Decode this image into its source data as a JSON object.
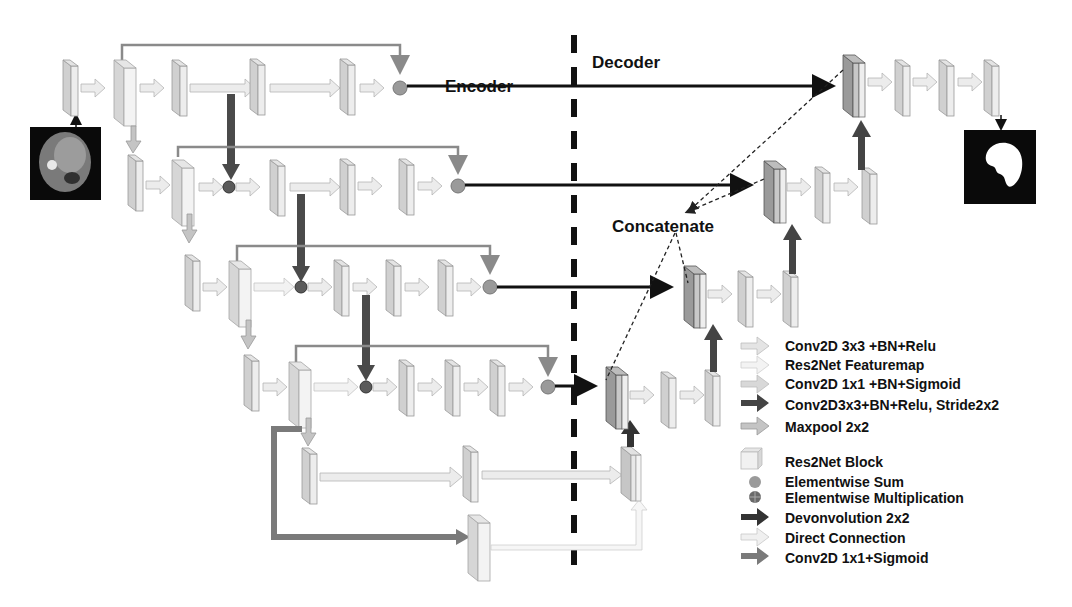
{
  "labels": {
    "encoder": "Encoder",
    "decoder": "Decoder",
    "concatenate": "Concatenate"
  },
  "images": {
    "input": "input-ct-slice",
    "output": "output-liver-mask"
  },
  "colors": {
    "conv3x3": "#e2e2e2",
    "res2net_featuremap": "#f1f1f1",
    "conv1x1_sigmoid_bn": "#d8d8d8",
    "stride_conv": "#4a4a4a",
    "maxpool": "#b8b8b8",
    "deconv": "#333333",
    "direct": "#ececec",
    "conv1x1_sigmoid": "#7a7a7a",
    "skip_line": "#8a8a8a",
    "block_face": "#d4d4d4",
    "block_side": "#ececec",
    "decoder_block": "#9a9a9a"
  },
  "legend": [
    {
      "icon": "arrow-light-icon",
      "label": "Conv2D 3x3 +BN+Relu"
    },
    {
      "icon": "arrow-lighter-icon",
      "label": "Res2Net Featuremap"
    },
    {
      "icon": "arrow-light-gray-icon",
      "label": "Conv2D 1x1 +BN+Sigmoid"
    },
    {
      "icon": "arrow-dark-icon",
      "label": "Conv2D3x3+BN+Relu, Stride2x2"
    },
    {
      "icon": "arrow-gray-icon",
      "label": "Maxpool 2x2"
    },
    {
      "icon": "cube-icon",
      "label": "Res2Net Block"
    },
    {
      "icon": "circle-sum-icon",
      "label": "Elementwise Sum"
    },
    {
      "icon": "circle-mult-icon",
      "label": "Elementwise Multiplication"
    },
    {
      "icon": "arrow-black-icon",
      "label": "Devonvolution 2x2"
    },
    {
      "icon": "arrow-white-icon",
      "label": "Direct Connection"
    },
    {
      "icon": "arrow-medium-gray-icon",
      "label": "Conv2D 1x1+Sigmoid"
    }
  ]
}
